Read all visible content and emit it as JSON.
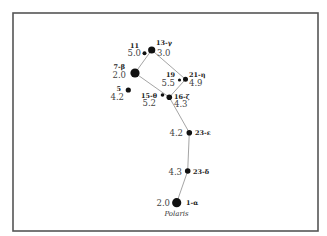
{
  "diagram": {
    "frame": {
      "x": 13,
      "y": 13,
      "width": 305,
      "height": 218,
      "stroke": "#555555"
    },
    "line_color": "#9a9a9a",
    "star_color": "#111111",
    "stars": [
      {
        "id": "s13",
        "designation": "13-γ",
        "magnitude": "3.0",
        "x": 151.7,
        "y": 50,
        "r": 3.6,
        "name_pos": {
          "x": 156,
          "y": 45,
          "anchor": "start"
        },
        "mag_pos": {
          "x": 157,
          "y": 56,
          "anchor": "start"
        }
      },
      {
        "id": "s11",
        "designation": "11",
        "magnitude": "5.0",
        "x": 144.5,
        "y": 53.3,
        "r": 2.0,
        "name_pos": {
          "x": 139,
          "y": 48,
          "anchor": "end"
        },
        "mag_pos": {
          "x": 141,
          "y": 56,
          "anchor": "end"
        }
      },
      {
        "id": "s7",
        "designation": "7-β",
        "magnitude": "2.0",
        "x": 135,
        "y": 73,
        "r": 4.6,
        "name_pos": {
          "x": 125,
          "y": 69,
          "anchor": "end"
        },
        "mag_pos": {
          "x": 126,
          "y": 78,
          "anchor": "end"
        }
      },
      {
        "id": "s5",
        "designation": "5",
        "magnitude": "4.2",
        "x": 128.3,
        "y": 90,
        "r": 2.6,
        "name_pos": {
          "x": 121,
          "y": 91,
          "anchor": "end"
        },
        "mag_pos": {
          "x": 124,
          "y": 100,
          "anchor": "end"
        }
      },
      {
        "id": "s19",
        "designation": "19",
        "magnitude": "5.5",
        "x": 179.5,
        "y": 80,
        "r": 1.6,
        "name_pos": {
          "x": 175,
          "y": 77,
          "anchor": "end"
        },
        "mag_pos": {
          "x": 175,
          "y": 86,
          "anchor": "end"
        }
      },
      {
        "id": "s21",
        "designation": "21-η",
        "magnitude": "4.9",
        "x": 185.5,
        "y": 79.3,
        "r": 2.5,
        "name_pos": {
          "x": 189,
          "y": 77,
          "anchor": "start"
        },
        "mag_pos": {
          "x": 189,
          "y": 86,
          "anchor": "start"
        }
      },
      {
        "id": "s15",
        "designation": "15-θ",
        "magnitude": "5.2",
        "x": 162.5,
        "y": 95,
        "r": 1.8,
        "name_pos": {
          "x": 157,
          "y": 98,
          "anchor": "end"
        },
        "mag_pos": {
          "x": 156,
          "y": 106,
          "anchor": "end"
        }
      },
      {
        "id": "s16",
        "designation": "16-ζ",
        "magnitude": "4.3",
        "x": 169.3,
        "y": 97.3,
        "r": 2.8,
        "name_pos": {
          "x": 174,
          "y": 99,
          "anchor": "start"
        },
        "mag_pos": {
          "x": 174,
          "y": 107,
          "anchor": "start"
        }
      },
      {
        "id": "s23e",
        "designation": "23-ε",
        "magnitude": "4.2",
        "x": 189.3,
        "y": 132.7,
        "r": 2.8,
        "name_pos": {
          "x": 195,
          "y": 135,
          "anchor": "start"
        },
        "mag_pos": {
          "x": 183,
          "y": 136,
          "anchor": "end"
        }
      },
      {
        "id": "s23d",
        "designation": "23-δ",
        "magnitude": "4.3",
        "x": 187.7,
        "y": 171,
        "r": 2.8,
        "name_pos": {
          "x": 193,
          "y": 174,
          "anchor": "start"
        },
        "mag_pos": {
          "x": 182,
          "y": 175,
          "anchor": "end"
        }
      },
      {
        "id": "s1",
        "designation": "1-α",
        "magnitude": "2.0",
        "x": 176.7,
        "y": 202.7,
        "r": 4.6,
        "name_pos": {
          "x": 186,
          "y": 205,
          "anchor": "start"
        },
        "mag_pos": {
          "x": 170,
          "y": 206,
          "anchor": "end"
        },
        "common_name": "Polaris",
        "common_pos": {
          "x": 176.5,
          "y": 216,
          "anchor": "middle"
        }
      }
    ],
    "edges": [
      [
        "s13",
        "s7"
      ],
      [
        "s13",
        "s21"
      ],
      [
        "s7",
        "s16"
      ],
      [
        "s21",
        "s16"
      ],
      [
        "s16",
        "s23e"
      ],
      [
        "s23e",
        "s23d"
      ],
      [
        "s23d",
        "s1"
      ]
    ]
  }
}
